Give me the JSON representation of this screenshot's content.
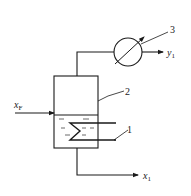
{
  "diagram": {
    "type": "single-stage evaporation / flash vessel schematic",
    "labels": {
      "feed": {
        "main": "x",
        "sub": "F"
      },
      "vapor_out": {
        "main": "y",
        "sub": "1"
      },
      "liquid_out": {
        "main": "x",
        "sub": "1"
      },
      "coil": "1",
      "vessel": "2",
      "condenser": "3"
    },
    "components": [
      {
        "id": "1",
        "name": "heating coil"
      },
      {
        "id": "2",
        "name": "vessel"
      },
      {
        "id": "3",
        "name": "heat exchanger / condenser"
      }
    ],
    "colors": {
      "line": "#1a1a1a",
      "background": "#ffffff"
    }
  }
}
